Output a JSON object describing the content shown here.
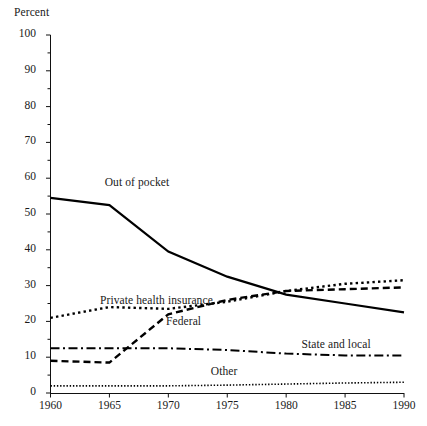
{
  "chart_data": {
    "type": "line",
    "title": "",
    "subtitle": "",
    "xlabel": "",
    "ylabel": "Percent",
    "xlim": [
      1960,
      1990
    ],
    "ylim": [
      0,
      100
    ],
    "grid": false,
    "legend_position": "inline-annotations",
    "x_ticks": [
      "1960",
      "1965",
      "1970",
      "1975",
      "1980",
      "1985",
      "1990"
    ],
    "x_tick_values": [
      1960,
      1965,
      1970,
      1975,
      1980,
      1985,
      1990
    ],
    "y_ticks": [
      "0",
      "10",
      "20",
      "30",
      "40",
      "50",
      "60",
      "70",
      "80",
      "90",
      "100"
    ],
    "y_tick_values": [
      0,
      10,
      20,
      30,
      40,
      50,
      60,
      70,
      80,
      90,
      100
    ],
    "y_minor_tick_values": [
      5,
      15,
      25,
      35,
      45,
      55,
      65,
      75,
      85,
      95
    ],
    "x": [
      1960,
      1965,
      1970,
      1975,
      1980,
      1985,
      1990
    ],
    "series": [
      {
        "name": "Out of pocket",
        "style": "solid",
        "color": "#000000",
        "label_x": 1964.6,
        "label_y": 58.5,
        "values": [
          54.5,
          52.5,
          39.5,
          32.5,
          27.5,
          25.0,
          22.5
        ]
      },
      {
        "name": "Private health insurance",
        "style": "dotted",
        "color": "#000000",
        "label_x": 1964.2,
        "label_y": 25.5,
        "values": [
          21.0,
          24.0,
          23.5,
          25.5,
          28.5,
          30.5,
          31.5
        ]
      },
      {
        "name": "Federal",
        "style": "dashed",
        "color": "#000000",
        "label_x": 1969.8,
        "label_y": 19.5,
        "values": [
          9.0,
          8.5,
          22.0,
          26.0,
          28.5,
          29.0,
          29.5
        ]
      },
      {
        "name": "State and local",
        "style": "dash-dot",
        "color": "#000000",
        "label_x": 1981.3,
        "label_y": 13.0,
        "values": [
          12.5,
          12.5,
          12.5,
          12.0,
          11.0,
          10.5,
          10.5
        ]
      },
      {
        "name": "Other",
        "style": "fine-dotted",
        "color": "#000000",
        "label_x": 1973.6,
        "label_y": 5.5,
        "values": [
          2.0,
          2.0,
          2.0,
          2.2,
          2.5,
          2.8,
          3.0
        ]
      }
    ]
  },
  "axes": {
    "y_axis_title": "Percent"
  }
}
